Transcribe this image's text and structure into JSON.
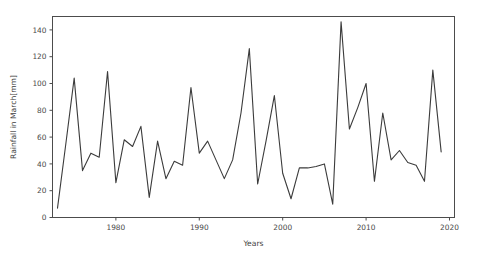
{
  "chart_data": {
    "type": "line",
    "title": "",
    "xlabel": "Years",
    "ylabel": "Rainfall in March[mm]",
    "xlim": [
      1972.4,
      2020.6
    ],
    "ylim": [
      0,
      150
    ],
    "xticks": [
      1980,
      1990,
      2000,
      2010,
      2020
    ],
    "xtick_labels": [
      "1980",
      "1990",
      "2000",
      "2010",
      "2020"
    ],
    "yticks": [
      0,
      20,
      40,
      60,
      80,
      100,
      120,
      140
    ],
    "ytick_labels": [
      "0",
      "20",
      "40",
      "60",
      "80",
      "100",
      "120",
      "140"
    ],
    "grid": false,
    "legend": false,
    "line_color": "#3b3b3b",
    "background_color": "#ffffff",
    "series": [
      {
        "name": "Rainfall in March",
        "x": [
          1973,
          1974,
          1975,
          1976,
          1977,
          1978,
          1979,
          1980,
          1981,
          1982,
          1983,
          1984,
          1985,
          1986,
          1987,
          1988,
          1989,
          1990,
          1991,
          1992,
          1993,
          1994,
          1995,
          1996,
          1997,
          1998,
          1999,
          2000,
          2001,
          2002,
          2003,
          2004,
          2005,
          2006,
          2007,
          2008,
          2009,
          2010,
          2011,
          2012,
          2013,
          2014,
          2015,
          2016,
          2017,
          2018,
          2019
        ],
        "values": [
          7,
          55,
          104,
          35,
          48,
          45,
          109,
          26,
          58,
          53,
          68,
          15,
          57,
          29,
          42,
          39,
          97,
          48,
          57,
          43,
          29,
          43,
          78,
          126,
          25,
          57,
          91,
          33,
          14,
          37,
          37,
          38,
          40,
          10,
          146,
          66,
          82,
          100,
          27,
          78,
          43,
          50,
          41,
          39,
          27,
          110,
          49
        ]
      }
    ]
  },
  "axes": {
    "ylabel": "Rainfall in March[mm]",
    "xlabel": "Years"
  }
}
